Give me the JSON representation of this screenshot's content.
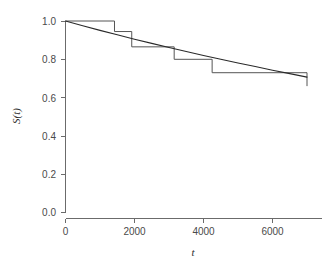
{
  "chart_data": {
    "type": "line",
    "title": "",
    "subtitle": "",
    "xlabel": "t",
    "ylabel": "S(t)",
    "xlim": [
      -200,
      7400
    ],
    "ylim": [
      0.0,
      1.0
    ],
    "grid": false,
    "legend": null,
    "xticks": [
      0,
      2000,
      4000,
      6000
    ],
    "xticklabels": [
      "0",
      "2000",
      "4000",
      "6000"
    ],
    "yticks": [
      0.0,
      0.2,
      0.4,
      0.6,
      0.8,
      1.0
    ],
    "yticklabels": [
      "0.0",
      "0.2",
      "0.4",
      "0.6",
      "0.8",
      "1.0"
    ],
    "series": [
      {
        "name": "Kaplan-Meier step estimate",
        "type": "step",
        "drawstyle": "steps-post",
        "color": "#555555",
        "x": [
          0,
          1420,
          1920,
          3150,
          4250,
          7000
        ],
        "y": [
          1.0,
          0.945,
          0.865,
          0.8,
          0.73,
          0.73
        ],
        "final_drop_y": 0.66
      },
      {
        "name": "Fitted smooth survival curve",
        "type": "line",
        "color": "#2a2a2a",
        "x": [
          0,
          500,
          1000,
          1500,
          2000,
          2500,
          3000,
          3500,
          4000,
          4500,
          5000,
          5500,
          6000,
          6500,
          7000
        ],
        "y": [
          1.0,
          0.975,
          0.951,
          0.928,
          0.905,
          0.883,
          0.862,
          0.841,
          0.82,
          0.8,
          0.781,
          0.762,
          0.743,
          0.725,
          0.707
        ]
      }
    ],
    "annotations": []
  },
  "axes": {
    "y_axis_name": "survival-probability-axis",
    "x_axis_name": "time-axis"
  }
}
